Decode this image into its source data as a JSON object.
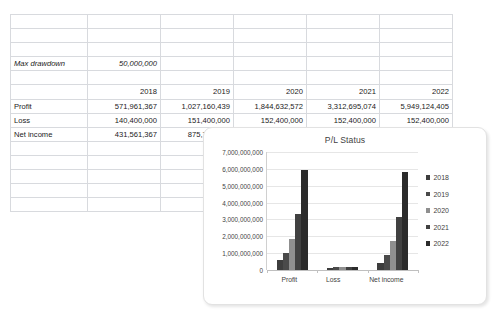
{
  "spreadsheet": {
    "max_drawdown": {
      "label": "Max drawdown",
      "value": "50,000,000"
    },
    "year_headers": [
      "2018",
      "2019",
      "2020",
      "2021",
      "2022"
    ],
    "rows": [
      {
        "label": "Profit",
        "values": [
          "571,961,367",
          "1,027,160,439",
          "1,844,632,572",
          "3,312,695,074",
          "5,949,124,405"
        ]
      },
      {
        "label": "Loss",
        "values": [
          "140,400,000",
          "151,400,000",
          "152,400,000",
          "152,400,000",
          "152,400,000"
        ]
      },
      {
        "label": "Net income",
        "values": [
          "431,561,367",
          "875,760,439",
          "1,692,232,572",
          "3,160,295,074",
          "5,796,724,405"
        ]
      }
    ]
  },
  "chart_data": {
    "type": "bar",
    "title": "P/L Status",
    "categories": [
      "Profit",
      "Loss",
      "Net income"
    ],
    "series": [
      {
        "name": "2018",
        "color": "#3d3d3d",
        "values": [
          571961367,
          140400000,
          431561367
        ]
      },
      {
        "name": "2019",
        "color": "#4a4a4a",
        "values": [
          1027160439,
          151400000,
          875760439
        ]
      },
      {
        "name": "2020",
        "color": "#8f8f8f",
        "values": [
          1844632572,
          152400000,
          1692232572
        ]
      },
      {
        "name": "2021",
        "color": "#414141",
        "values": [
          3312695074,
          152400000,
          3160295074
        ]
      },
      {
        "name": "2022",
        "color": "#2b2b2b",
        "values": [
          5949124405,
          152400000,
          5796724405
        ]
      }
    ],
    "ylim": [
      0,
      7000000000
    ],
    "yticks": [
      0,
      1000000000,
      2000000000,
      3000000000,
      4000000000,
      5000000000,
      6000000000,
      7000000000
    ],
    "ytick_labels": [
      "0",
      "1,000,000,000",
      "2,000,000,000",
      "3,000,000,000",
      "4,000,000,000",
      "5,000,000,000",
      "6,000,000,000",
      "7,000,000,000"
    ],
    "xlabel": "",
    "ylabel": "",
    "grid": true,
    "legend_position": "right"
  }
}
